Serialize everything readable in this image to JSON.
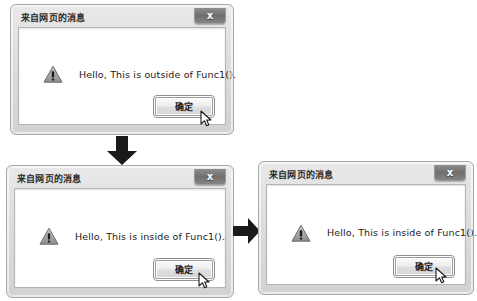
{
  "page": {
    "background_color": "#ffffff"
  },
  "common": {
    "title": "来自网页的消息",
    "close_icon": "close-icon",
    "close_glyph": "x",
    "ok_label": "确定",
    "warning_icon": "warning-triangle-icon",
    "cursor_icon": "mouse-pointer-icon",
    "title_color": "#2b2b2b",
    "client_background": "#ffffff",
    "chrome_color": "#dcdcdc"
  },
  "dialogs": [
    {
      "id": "dialog-1",
      "title": "来自网页的消息",
      "message": "Hello, This is outside of Func1().",
      "ok_label": "确定",
      "close_glyph": "x"
    },
    {
      "id": "dialog-2",
      "title": "来自网页的消息",
      "message": "Hello, This is inside of Func1().",
      "ok_label": "确定",
      "close_glyph": "x"
    },
    {
      "id": "dialog-3",
      "title": "来自网页的消息",
      "message": "Hello, This is inside of Func1().",
      "ok_label": "确定",
      "close_glyph": "x"
    }
  ],
  "arrows": [
    {
      "name": "arrow-down-icon",
      "direction": "down",
      "color": "#1a1a1a"
    },
    {
      "name": "arrow-right-icon",
      "direction": "right",
      "color": "#1a1a1a"
    }
  ]
}
